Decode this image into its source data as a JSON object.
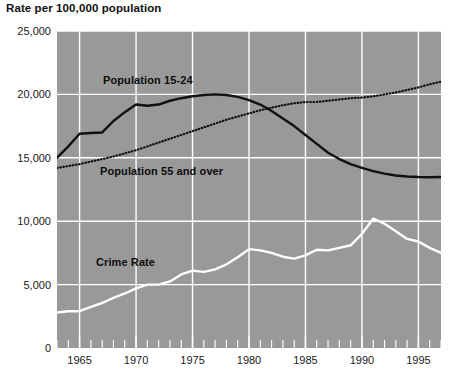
{
  "chart": {
    "title": "Rate per 100,000 population",
    "plot_background_color": "#999999",
    "page_background_color": "#ffffff"
  },
  "axes": {
    "y_tick_labels": [
      "25,000",
      "20,000",
      "15,000",
      "10,000",
      "5,000",
      "0"
    ],
    "y_tick_values": [
      25000,
      20000,
      15000,
      10000,
      5000,
      0
    ],
    "x_tick_labels": [
      "1965",
      "1970",
      "1975",
      "1980",
      "1985",
      "1990",
      "1995"
    ],
    "x_tick_values": [
      1965,
      1970,
      1975,
      1980,
      1985,
      1990,
      1995
    ]
  },
  "series_labels": {
    "population_15_24": "Population 15-24",
    "population_55_over": "Population 55 and over",
    "crime_rate": "Crime Rate"
  },
  "chart_data": {
    "type": "line",
    "title": "Rate per 100,000 population",
    "xlabel": "",
    "ylabel": "Rate per 100,000 population",
    "xlim": [
      1963,
      1997
    ],
    "ylim": [
      0,
      25000
    ],
    "grid": true,
    "legend": "inline-annotations",
    "x": [
      1963,
      1964,
      1965,
      1966,
      1967,
      1968,
      1969,
      1970,
      1971,
      1972,
      1973,
      1974,
      1975,
      1976,
      1977,
      1978,
      1979,
      1980,
      1981,
      1982,
      1983,
      1984,
      1985,
      1986,
      1987,
      1988,
      1989,
      1990,
      1991,
      1992,
      1993,
      1994,
      1995,
      1996,
      1997
    ],
    "series": [
      {
        "name": "Population 15-24",
        "style": "solid",
        "color": "#111111",
        "values": [
          15000,
          15900,
          16900,
          16950,
          17000,
          17900,
          18600,
          19200,
          19100,
          19200,
          19500,
          19700,
          19850,
          19950,
          20000,
          19950,
          19800,
          19550,
          19200,
          18700,
          18100,
          17500,
          16800,
          16100,
          15400,
          14900,
          14500,
          14200,
          13950,
          13750,
          13600,
          13520,
          13480,
          13470,
          13480
        ]
      },
      {
        "name": "Population 55 and over",
        "style": "dotted",
        "color": "#111111",
        "values": [
          14200,
          14350,
          14500,
          14700,
          14900,
          15100,
          15350,
          15600,
          15900,
          16200,
          16500,
          16800,
          17100,
          17400,
          17700,
          18000,
          18250,
          18500,
          18750,
          18950,
          19150,
          19300,
          19400,
          19400,
          19500,
          19600,
          19700,
          19750,
          19850,
          20000,
          20150,
          20350,
          20550,
          20800,
          21000
        ]
      },
      {
        "name": "Crime Rate",
        "style": "solid",
        "color": "#ffffff",
        "values": [
          2800,
          2900,
          2900,
          3250,
          3550,
          3950,
          4300,
          4700,
          5000,
          5000,
          5250,
          5800,
          6100,
          6000,
          6200,
          6600,
          7150,
          7800,
          7700,
          7500,
          7200,
          7050,
          7300,
          7750,
          7700,
          7900,
          8100,
          9000,
          10200,
          9800,
          9200,
          8600,
          8400,
          7900,
          7500
        ]
      }
    ]
  }
}
